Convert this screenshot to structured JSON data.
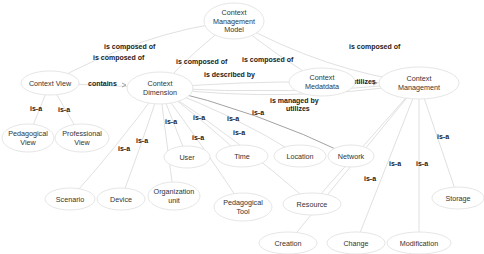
{
  "nodes": [
    {
      "id": "cmm",
      "lines": [
        "Context",
        "Management",
        "Model"
      ]
    },
    {
      "id": "cv",
      "lines": [
        "Context View"
      ]
    },
    {
      "id": "cd",
      "lines": [
        "Context",
        "Dimension"
      ]
    },
    {
      "id": "cmd",
      "lines": [
        "Context",
        "Medatdata"
      ]
    },
    {
      "id": "cm",
      "lines": [
        "Context",
        "Management"
      ]
    },
    {
      "id": "pv",
      "lines": [
        "Pedagogical",
        "View"
      ]
    },
    {
      "id": "prv",
      "lines": [
        "Professional",
        "View"
      ]
    },
    {
      "id": "user",
      "lines": [
        "User"
      ]
    },
    {
      "id": "time",
      "lines": [
        "Time"
      ]
    },
    {
      "id": "loc",
      "lines": [
        "Location"
      ]
    },
    {
      "id": "net",
      "lines": [
        "Network"
      ]
    },
    {
      "id": "scen",
      "lines": [
        "Scenario"
      ]
    },
    {
      "id": "dev",
      "lines": [
        "Device"
      ]
    },
    {
      "id": "org",
      "lines": [
        "Organization",
        "unit"
      ]
    },
    {
      "id": "ptool",
      "lines": [
        "Pedagogical",
        "Tool"
      ]
    },
    {
      "id": "res",
      "lines": [
        "Resource"
      ]
    },
    {
      "id": "stor",
      "lines": [
        "Storage"
      ]
    },
    {
      "id": "crea",
      "lines": [
        "Creation"
      ]
    },
    {
      "id": "chg",
      "lines": [
        "Change"
      ]
    },
    {
      "id": "mod",
      "lines": [
        "Modification"
      ]
    }
  ],
  "edge_labels": [
    {
      "id": "cmm-cv",
      "text": "is composed of"
    },
    {
      "id": "cmm-cd-a",
      "text": "is composed of"
    },
    {
      "id": "cmm-cd-b",
      "text": "is composed of"
    },
    {
      "id": "cmm-cmd",
      "text": "is composed of"
    },
    {
      "id": "cmm-cm",
      "text": "is composed of"
    },
    {
      "id": "cv-cd",
      "text": "contains"
    },
    {
      "id": "cd-cmd",
      "text": "is described by"
    },
    {
      "id": "cmd-cm",
      "text": "utilizes"
    },
    {
      "id": "cd-cm-managed",
      "text": "is managed by"
    },
    {
      "id": "cd-cm-utilizes",
      "text": "utilizes"
    },
    {
      "id": "cv-pv",
      "text": "is-a"
    },
    {
      "id": "cv-prv",
      "text": "is-a"
    },
    {
      "id": "cd-scen",
      "text": "is-a"
    },
    {
      "id": "cd-dev",
      "text": "is-a"
    },
    {
      "id": "cd-org",
      "text": "is-a"
    },
    {
      "id": "cd-user",
      "text": "is-a"
    },
    {
      "id": "cd-ptool",
      "text": "is-a"
    },
    {
      "id": "cd-time",
      "text": "is-a"
    },
    {
      "id": "cd-res",
      "text": "is-a"
    },
    {
      "id": "cd-loc",
      "text": "is-a"
    },
    {
      "id": "cm-stor",
      "text": "is-a"
    },
    {
      "id": "cm-crea",
      "text": "is-a"
    },
    {
      "id": "cm-chg",
      "text": "is-a"
    },
    {
      "id": "cm-mod",
      "text": "is-a"
    }
  ]
}
